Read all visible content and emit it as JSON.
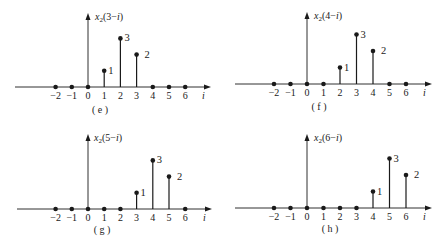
{
  "colors": {
    "ink": "#1a1a1a",
    "background": "#ffffff"
  },
  "panels": [
    {
      "id": "e",
      "caption": "( e )",
      "ylabel_func": "x",
      "ylabel_sub": "2",
      "ylabel_arg": "(3−",
      "ylabel_var": "i",
      "ylabel_close": ")",
      "xlabel": "i",
      "origin": [
        88,
        87
      ],
      "axis_start_x": 15,
      "axis_end_x": 211,
      "axis_top_y": 13,
      "unit_px": 16.2,
      "label_pos": [
        95,
        20
      ],
      "caption_pos": [
        100,
        113
      ]
    },
    {
      "id": "f",
      "caption": "( f )",
      "ylabel_func": "x",
      "ylabel_sub": "2",
      "ylabel_arg": "(4−",
      "ylabel_var": "i",
      "ylabel_close": ")",
      "xlabel": "i",
      "origin": [
        307,
        84
      ],
      "axis_start_x": 235,
      "axis_end_x": 432,
      "axis_top_y": 12,
      "unit_px": 16.5,
      "label_pos": [
        314,
        19
      ],
      "caption_pos": [
        319,
        110
      ]
    },
    {
      "id": "g",
      "caption": "( g )",
      "ylabel_func": "x",
      "ylabel_sub": "2",
      "ylabel_arg": "(5−",
      "ylabel_var": "i",
      "ylabel_close": ")",
      "xlabel": "i",
      "origin": [
        88,
        209
      ],
      "axis_start_x": 17,
      "axis_end_x": 212,
      "axis_top_y": 134,
      "unit_px": 16.2,
      "label_pos": [
        94,
        141
      ],
      "caption_pos": [
        102,
        233
      ]
    },
    {
      "id": "h",
      "caption": "( h )",
      "ylabel_func": "x",
      "ylabel_sub": "2",
      "ylabel_arg": "(6−",
      "ylabel_var": "i",
      "ylabel_close": ")",
      "xlabel": "i",
      "origin": [
        307,
        208
      ],
      "axis_start_x": 235,
      "axis_end_x": 432,
      "axis_top_y": 134,
      "unit_px": 16.5,
      "label_pos": [
        314,
        141
      ],
      "caption_pos": [
        330,
        232
      ]
    }
  ],
  "chart_data": [
    {
      "type": "stem",
      "title": "x2(3−i)",
      "caption": "(e)",
      "xlabel": "i",
      "ylabel": "x2(3−i)",
      "x": [
        -2,
        -1,
        0,
        1,
        2,
        3,
        4,
        5,
        6
      ],
      "values": [
        0,
        0,
        0,
        1,
        3,
        2,
        0,
        0,
        0
      ],
      "annotations": [
        {
          "x": 1,
          "text": "1"
        },
        {
          "x": 2,
          "text": "3"
        },
        {
          "x": 3,
          "text": "2"
        }
      ],
      "grid": false
    },
    {
      "type": "stem",
      "title": "x2(4−i)",
      "caption": "(f)",
      "xlabel": "i",
      "ylabel": "x2(4−i)",
      "x": [
        -2,
        -1,
        0,
        1,
        2,
        3,
        4,
        5,
        6
      ],
      "values": [
        0,
        0,
        0,
        0,
        1,
        3,
        2,
        0,
        0
      ],
      "annotations": [
        {
          "x": 2,
          "text": "1"
        },
        {
          "x": 3,
          "text": "3"
        },
        {
          "x": 4,
          "text": "2"
        }
      ],
      "grid": false
    },
    {
      "type": "stem",
      "title": "x2(5−i)",
      "caption": "(g)",
      "xlabel": "i",
      "ylabel": "x2(5−i)",
      "x": [
        -2,
        -1,
        0,
        1,
        2,
        3,
        4,
        5,
        6
      ],
      "values": [
        0,
        0,
        0,
        0,
        0,
        1,
        3,
        2,
        0
      ],
      "annotations": [
        {
          "x": 3,
          "text": "1"
        },
        {
          "x": 4,
          "text": "3"
        },
        {
          "x": 5,
          "text": "2"
        }
      ],
      "grid": false
    },
    {
      "type": "stem",
      "title": "x2(6−i)",
      "caption": "(h)",
      "xlabel": "i",
      "ylabel": "x2(6−i)",
      "x": [
        -2,
        -1,
        0,
        1,
        2,
        3,
        4,
        5,
        6
      ],
      "values": [
        0,
        0,
        0,
        0,
        0,
        0,
        1,
        3,
        2
      ],
      "annotations": [
        {
          "x": 4,
          "text": "1"
        },
        {
          "x": 5,
          "text": "3"
        },
        {
          "x": 6,
          "text": "2"
        }
      ],
      "grid": false
    }
  ]
}
